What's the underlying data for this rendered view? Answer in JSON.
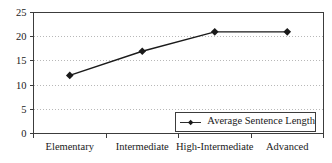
{
  "chart_data": {
    "type": "line",
    "title": "",
    "categories": [
      "Elementary",
      "Intermediate",
      "High-Intermediate",
      "Advanced"
    ],
    "series": [
      {
        "name": "Average Sentence Length",
        "values": [
          12,
          17,
          21,
          21
        ],
        "color": "#1a1a1a",
        "marker": "diamond"
      }
    ],
    "y_axis": {
      "min": 0,
      "max": 25,
      "tick_step": 5,
      "ticks": [
        0,
        5,
        10,
        15,
        20,
        25
      ]
    },
    "x_axis": {
      "tick_position": "between-categories"
    },
    "grid": {
      "horizontal": true,
      "style": "dotted",
      "color": "#b8b8b8"
    },
    "legend": {
      "label": "Average Sentence Length",
      "position": "inside-bottom-right"
    },
    "colors": {
      "axis": "#3c3c3c",
      "background": "#ffffff",
      "text": "#1a1a1a"
    }
  }
}
